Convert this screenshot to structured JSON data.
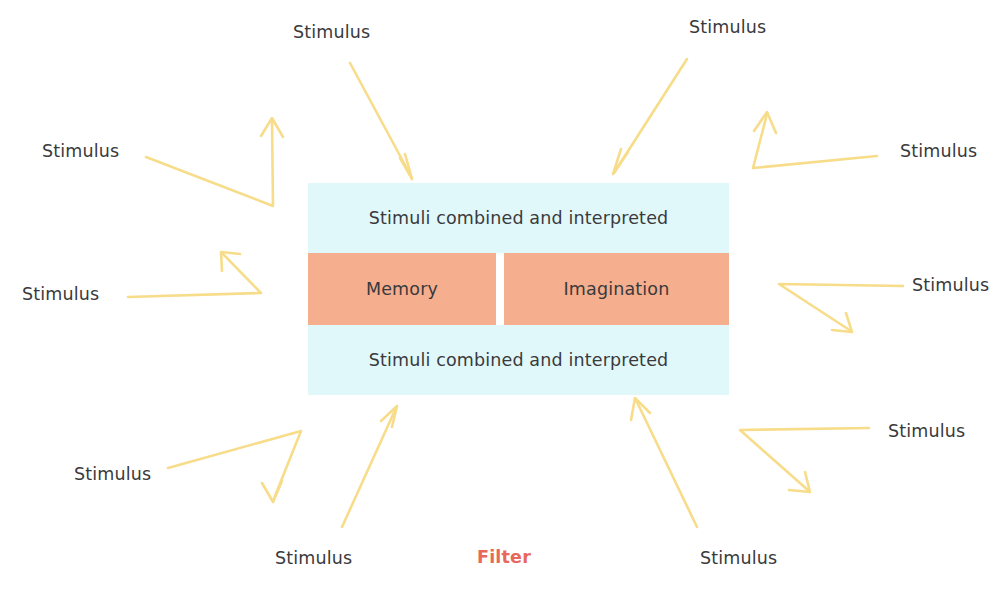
{
  "diagram": {
    "colors": {
      "arrow": "#f7dc8a",
      "band_fill": "#e1f8fb",
      "cell_fill": "#f5ae8e",
      "text": "#3a3a3c",
      "filter_accent": "#e8685a",
      "background": "#ffffff"
    },
    "center": {
      "band_top_label": "Stimuli combined and interpreted",
      "band_bottom_label": "Stimuli combined and interpreted",
      "cells": [
        {
          "id": "memory",
          "label": "Memory"
        },
        {
          "id": "imagination",
          "label": "Imagination"
        }
      ]
    },
    "filter_label": "Filter",
    "stimulus_labels": [
      {
        "id": "top-center",
        "text": "Stimulus",
        "x": 293,
        "y": 24
      },
      {
        "id": "top-right",
        "text": "Stimulus",
        "x": 689,
        "y": 19
      },
      {
        "id": "left-upper",
        "text": "Stimulus",
        "x": 42,
        "y": 143
      },
      {
        "id": "right-upper",
        "text": "Stimulus",
        "x": 900,
        "y": 143
      },
      {
        "id": "left-middle",
        "text": "Stimulus",
        "x": 22,
        "y": 286
      },
      {
        "id": "right-middle",
        "text": "Stimulus",
        "x": 912,
        "y": 277
      },
      {
        "id": "right-lower",
        "text": "Stimulus",
        "x": 888,
        "y": 423
      },
      {
        "id": "left-lower",
        "text": "Stimulus",
        "x": 74,
        "y": 466
      },
      {
        "id": "bottom-left",
        "text": "Stimulus",
        "x": 275,
        "y": 550
      },
      {
        "id": "bottom-right",
        "text": "Stimulus",
        "x": 700,
        "y": 550
      }
    ],
    "filter_position": {
      "x": 477,
      "y": 549
    },
    "arrows": [
      {
        "id": "arrow-top-center",
        "points": "350,63 412,178",
        "head": "412,178"
      },
      {
        "id": "arrow-top-right",
        "points": "687,59 614,173",
        "head": "614,173"
      },
      {
        "id": "arrow-left-upper",
        "points": "146,157 273,206 272,120",
        "head": "272,120"
      },
      {
        "id": "arrow-right-upper",
        "points": "877,156 753,168 767,114",
        "head": "767,114"
      },
      {
        "id": "arrow-left-middle",
        "points": "128,297 261,293 222,253",
        "head": "222,253"
      },
      {
        "id": "arrow-right-middle",
        "points": "903,286 779,284 851,331",
        "head": "851,331"
      },
      {
        "id": "arrow-right-lower",
        "points": "869,428 740,430 809,491",
        "head": "809,491"
      },
      {
        "id": "arrow-left-lower",
        "points": "168,468 301,431 273,501",
        "head": "273,501"
      },
      {
        "id": "arrow-bottom-left",
        "points": "342,527 396,408",
        "head": "396,408"
      },
      {
        "id": "arrow-bottom-right",
        "points": "697,527 636,400",
        "head": "636,400"
      }
    ]
  }
}
